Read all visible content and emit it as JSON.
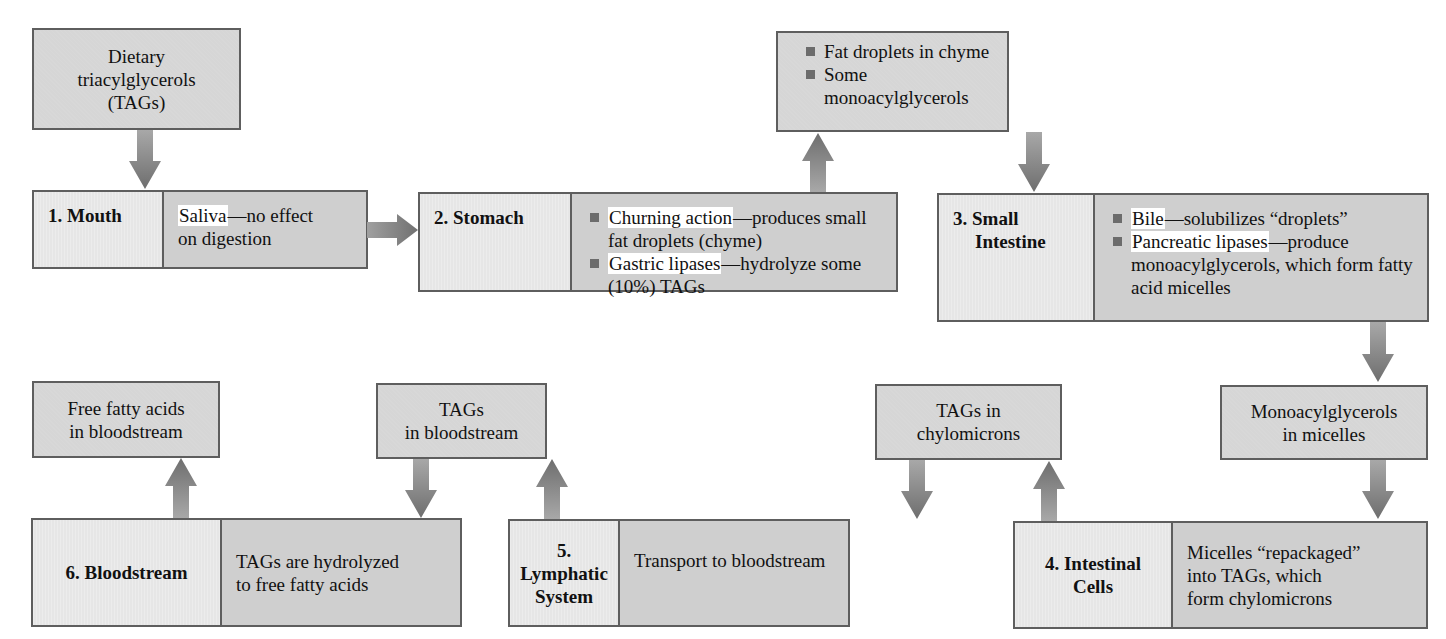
{
  "diagram": {
    "start": {
      "text_lines": [
        "Dietary",
        "triacylglycerols",
        "(TAGs)"
      ]
    },
    "stages": [
      {
        "id": "mouth",
        "label_lines": [
          "1. Mouth"
        ],
        "description": {
          "highlight": "Saliva",
          "rest_line1": "—no effect",
          "rest_line2": "on digestion"
        }
      },
      {
        "id": "stomach",
        "label_lines": [
          "2. Stomach"
        ],
        "bullets": [
          {
            "highlight": "Churning action",
            "rest": "—produces small fat droplets (chyme)"
          },
          {
            "highlight": "Gastric lipases",
            "rest": "—hydrolyze some (10%) TAGs"
          }
        ]
      },
      {
        "id": "small-intestine",
        "label_lines": [
          "3. Small",
          "Intestine"
        ],
        "bullets": [
          {
            "highlight": "Bile",
            "rest": "—solubilizes “droplets”"
          },
          {
            "highlight": "Pancreatic lipases",
            "rest": "—produce monoacylglycerols, which form fatty acid micelles"
          }
        ]
      },
      {
        "id": "intestinal-cells",
        "label_lines": [
          "4. Intestinal",
          "Cells"
        ],
        "description_lines": [
          "Micelles “repackaged”",
          "into TAGs, which",
          "form chylomicrons"
        ]
      },
      {
        "id": "lymphatic-system",
        "label_lines": [
          "5. Lymphatic",
          "System"
        ],
        "description_lines": [
          "Transport to bloodstream"
        ]
      },
      {
        "id": "bloodstream",
        "label_lines": [
          "6. Bloodstream"
        ],
        "description_lines": [
          "TAGs are hydrolyzed",
          "to free fatty acids"
        ]
      }
    ],
    "products": {
      "chyme": {
        "bullets": [
          "Fat droplets in chyme",
          "Some monoacylglycerols"
        ]
      },
      "micelles": {
        "text_lines": [
          "Monoacylglycerols",
          "in micelles"
        ]
      },
      "chylomicrons": {
        "text_lines": [
          "TAGs in",
          "chylomicrons"
        ]
      },
      "tags_bloodstream": {
        "text_lines": [
          "TAGs",
          "in bloodstream"
        ]
      },
      "free_fatty_acids": {
        "text_lines": [
          "Free fatty acids",
          "in bloodstream"
        ]
      }
    },
    "colors": {
      "box_fill": "#d6d6d6",
      "label_fill": "#e6e6e6",
      "border": "#5e5e5e",
      "arrow": "#7a7a7a",
      "highlight": "#ffffff",
      "bullet": "#6c6c6c"
    }
  }
}
